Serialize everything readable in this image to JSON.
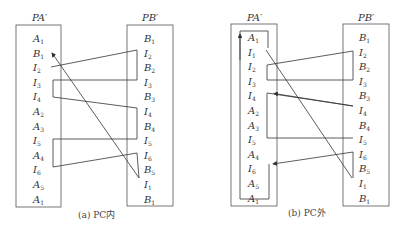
{
  "figures": [
    {
      "id": "a",
      "caption": "(a) PC内",
      "left_title": "PA′",
      "right_title": "PB′",
      "left_items": [
        "A1",
        "B1",
        "I2",
        "I3",
        "I4",
        "A2",
        "A3",
        "I5",
        "A4",
        "I6",
        "A5",
        "A1"
      ],
      "right_items": [
        "B1",
        "I2",
        "B2",
        "I3",
        "B3",
        "I4",
        "B4",
        "I5",
        "I6",
        "B5",
        "I1",
        "B1"
      ]
    },
    {
      "id": "b",
      "caption": "(b) PC外",
      "left_title": "PA′",
      "right_title": "PB′",
      "left_items": [
        "A1",
        "I1",
        "I2",
        "I3",
        "I4",
        "A2",
        "A3",
        "I5",
        "A4",
        "I6",
        "A5",
        "A1"
      ],
      "right_items": [
        "B1",
        "I2",
        "B2",
        "I3",
        "B3",
        "I4",
        "B4",
        "I5",
        "I6",
        "B5",
        "I1",
        "B1"
      ]
    }
  ]
}
